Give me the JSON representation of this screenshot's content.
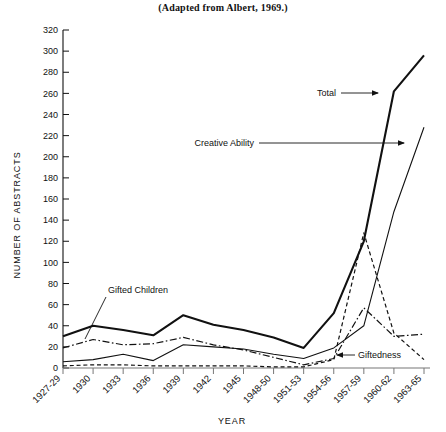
{
  "figure": {
    "title": "(Adapted from Albert, 1969.)",
    "y_axis_title": "NUMBER OF ABSTRACTS",
    "x_axis_title": "YEAR"
  },
  "annotations": {
    "total": "Total",
    "creative_ability": "Creative Ability",
    "gifted_children": "Gifted Children",
    "giftedness": "Giftedness"
  },
  "chart_data": {
    "type": "line",
    "title": "(Adapted from Albert, 1969.)",
    "xlabel": "YEAR",
    "ylabel": "NUMBER OF ABSTRACTS",
    "ylim": [
      0,
      320
    ],
    "yticks": [
      0,
      20,
      40,
      60,
      80,
      100,
      120,
      140,
      160,
      180,
      200,
      220,
      240,
      260,
      280,
      300,
      320
    ],
    "grid": false,
    "legend": "inline-annotations",
    "categories": [
      "1927-29",
      "1930",
      "1933",
      "1936",
      "1939",
      "1942",
      "1945",
      "1948-50",
      "1951-53",
      "1954-56",
      "1957-59",
      "1960-62",
      "1963-65"
    ],
    "series": [
      {
        "name": "Total",
        "style": "solid-thick",
        "values": [
          30,
          40,
          36,
          31,
          50,
          41,
          36,
          29,
          19,
          52,
          120,
          262,
          296
        ]
      },
      {
        "name": "Gifted Children",
        "style": "dash-dot",
        "values": [
          19,
          27,
          22,
          23,
          29,
          22,
          17,
          10,
          3,
          9,
          57,
          30,
          32
        ]
      },
      {
        "name": "Creative Ability",
        "style": "solid-thin",
        "values": [
          6,
          8,
          13,
          7,
          22,
          20,
          18,
          13,
          9,
          19,
          40,
          148,
          228
        ]
      },
      {
        "name": "Giftedness",
        "style": "dashed",
        "values": [
          2,
          3,
          3,
          2,
          2,
          2,
          2,
          1,
          1,
          8,
          128,
          33,
          8
        ]
      }
    ]
  }
}
